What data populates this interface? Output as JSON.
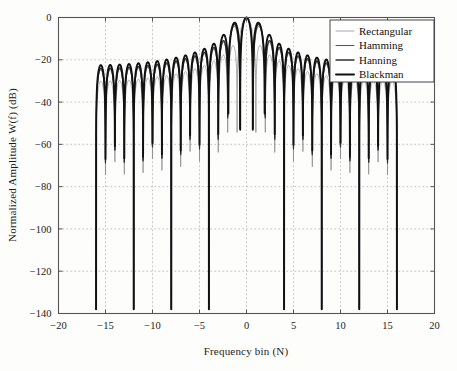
{
  "chart_data": {
    "type": "line",
    "title": "",
    "xlabel": "Frequency bin (N)",
    "ylabel": "Normalized Amplitude W(f) (dB)",
    "xlim": [
      -20,
      20
    ],
    "ylim": [
      -140,
      0
    ],
    "xticks": [
      -20,
      -15,
      -10,
      -5,
      0,
      5,
      10,
      15,
      20
    ],
    "xtick_labels": [
      "-20",
      "-15",
      "-10",
      "-5",
      "0",
      "5",
      "10",
      "15",
      "20"
    ],
    "yticks": [
      0,
      -20,
      -40,
      -60,
      -80,
      -100,
      -120,
      -140
    ],
    "ytick_labels": [
      "0",
      "-20",
      "-40",
      "-60",
      "-80",
      "-100",
      "-120",
      "-140"
    ],
    "grid": true,
    "grid_style": "dotted",
    "legend_position": "top-right",
    "data_x_range": [
      -16,
      16
    ],
    "series": [
      {
        "name": "Rectangular",
        "window": "rectangular",
        "line_width": 0.75,
        "color": "#8c8c8c",
        "main_lobe_half_width_bins": 1.0,
        "first_sidelobe_db": -13.3,
        "sidelobe_falloff_db_per_decade": -20,
        "peak_envelope_db": [
          -13.3,
          -17.8,
          -20.8,
          -23.0,
          -24.8,
          -26.2,
          -27.5,
          -28.6,
          -29.5,
          -30.4,
          -31.2,
          -31.9,
          -32.5,
          -33.1,
          -33.7
        ],
        "notes": "Highest sidelobes; envelope runs from about -13 dB near center to about -33 dB near bin 15"
      },
      {
        "name": "Hamming",
        "window": "hamming",
        "line_width": 1.0,
        "color": "#555555",
        "main_lobe_half_width_bins": 2.0,
        "first_sidelobe_db": -42.7,
        "peak_envelope_db": [
          -42.7,
          -44.0,
          -45.2,
          -46.6,
          -48.0,
          -49.2,
          -50.3,
          -51.2,
          -52.1,
          -53.0,
          -53.8,
          -54.5,
          -55.2,
          -55.8,
          -56.3
        ],
        "notes": "Sidelobes nearly flat in the -43 to -57 dB band"
      },
      {
        "name": "Hanning",
        "window": "hanning",
        "line_width": 1.3,
        "color": "#303030",
        "main_lobe_half_width_bins": 2.0,
        "first_sidelobe_db": -31.5,
        "peak_envelope_db": [
          -31.5,
          -41.5,
          -48.0,
          -53.0,
          -57.0,
          -60.5,
          -63.5,
          -66.0,
          -68.5,
          -70.5,
          -72.5,
          -74.5,
          -76.0,
          -78.0,
          -79.5
        ],
        "notes": "Sidelobes fall off about -18 dB per octave reaching roughly -90 dB near the band edge"
      },
      {
        "name": "Blackman",
        "window": "blackman",
        "line_width": 1.9,
        "color": "#111111",
        "main_lobe_half_width_bins": 3.0,
        "first_sidelobe_db": -58.1,
        "peak_envelope_db": [
          -58.1,
          -62.0,
          -66.0,
          -69.5,
          -72.5,
          -75.5,
          -78.0,
          -80.5,
          -83.0,
          -85.0,
          -87.0,
          -89.0,
          -91.0,
          -93.0,
          -95.0
        ],
        "notes": "Widest main lobe, lowest sidelobes, reaching below -100 dB at the band edges"
      }
    ],
    "annotations": []
  },
  "axes": {
    "x_title": "Frequency bin (N)",
    "y_title": "Normalized Amplitude W(f) (dB)"
  },
  "legend": {
    "entries": [
      {
        "label": "Rectangular"
      },
      {
        "label": "Hamming"
      },
      {
        "label": "Hanning"
      },
      {
        "label": "Blackman"
      }
    ]
  },
  "ticks": {
    "x": [
      "-20",
      "-15",
      "-10",
      "-5",
      "0",
      "5",
      "10",
      "15",
      "20"
    ],
    "y": [
      "0",
      "-20",
      "-40",
      "-60",
      "-80",
      "-100",
      "-120",
      "-140"
    ]
  },
  "artifact": {
    "bottom_text": ""
  }
}
